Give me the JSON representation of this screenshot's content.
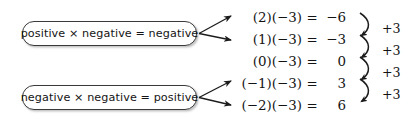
{
  "figure": {
    "background_color": "#ffffff",
    "text_color": "#131313",
    "box_border_color": "#3a3a3a"
  },
  "rule_boxes": [
    {
      "id": "positive-negative",
      "text": "positive × negative = negative",
      "points_to_rows": [
        0,
        1
      ]
    },
    {
      "id": "negative-negative",
      "text": "negative × negative = positive",
      "points_to_rows": [
        3,
        4
      ]
    }
  ],
  "equations": [
    {
      "lhs": "(2)(−3)",
      "eq": "=",
      "result": "−6"
    },
    {
      "lhs": "(1)(−3)",
      "eq": "=",
      "result": "−3"
    },
    {
      "lhs": "(0)(−3)",
      "eq": "=",
      "result": "0"
    },
    {
      "lhs": "(−1)(−3)",
      "eq": "=",
      "result": "3"
    },
    {
      "lhs": "(−2)(−3)",
      "eq": "=",
      "result": "6"
    }
  ],
  "step_annotations": [
    {
      "label": "+3",
      "between_rows": [
        0,
        1
      ]
    },
    {
      "label": "+3",
      "between_rows": [
        1,
        2
      ]
    },
    {
      "label": "+3",
      "between_rows": [
        2,
        3
      ]
    },
    {
      "label": "+3",
      "between_rows": [
        3,
        4
      ]
    }
  ],
  "icons": {
    "pointer_arrow": "arrow-right-icon",
    "step_curve": "curved-brace-arrow-icon"
  }
}
